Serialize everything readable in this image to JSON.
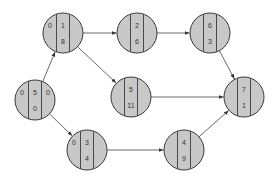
{
  "diagram": {
    "type": "activity-on-node network",
    "style": {
      "node_fill": "#c8c8c8",
      "node_stroke": "#3a3a3a",
      "edge_color": "#444444",
      "background": "#ffffff"
    },
    "nodes": [
      {
        "id": "n0",
        "cx": 35,
        "cy": 100,
        "r": 20,
        "top": "5",
        "bottom": "0",
        "left": "0",
        "right": "0"
      },
      {
        "id": "n1",
        "cx": 63,
        "cy": 33,
        "r": 20,
        "top": "1",
        "bottom": "8",
        "left": "0",
        "right": ""
      },
      {
        "id": "n2",
        "cx": 137,
        "cy": 33,
        "r": 20,
        "top": "2",
        "bottom": "6",
        "left": "",
        "right": ""
      },
      {
        "id": "n6",
        "cx": 210,
        "cy": 33,
        "r": 20,
        "top": "6",
        "bottom": "3",
        "left": "",
        "right": ""
      },
      {
        "id": "n5",
        "cx": 131,
        "cy": 97,
        "r": 20,
        "top": "5",
        "bottom": "11",
        "left": "",
        "right": ""
      },
      {
        "id": "n7",
        "cx": 244,
        "cy": 97,
        "r": 20,
        "top": "7",
        "bottom": "1",
        "left": "",
        "right": ""
      },
      {
        "id": "n3",
        "cx": 87,
        "cy": 150,
        "r": 20,
        "top": "3",
        "bottom": "4",
        "left": "0",
        "right": ""
      },
      {
        "id": "n4",
        "cx": 184,
        "cy": 150,
        "r": 20,
        "top": "4",
        "bottom": "9",
        "left": "",
        "right": ""
      }
    ],
    "edges": [
      {
        "from": "n0",
        "to": "n1"
      },
      {
        "from": "n0",
        "to": "n3"
      },
      {
        "from": "n1",
        "to": "n2"
      },
      {
        "from": "n1",
        "to": "n5"
      },
      {
        "from": "n2",
        "to": "n6"
      },
      {
        "from": "n6",
        "to": "n7"
      },
      {
        "from": "n5",
        "to": "n7"
      },
      {
        "from": "n3",
        "to": "n4"
      },
      {
        "from": "n4",
        "to": "n7"
      }
    ]
  }
}
